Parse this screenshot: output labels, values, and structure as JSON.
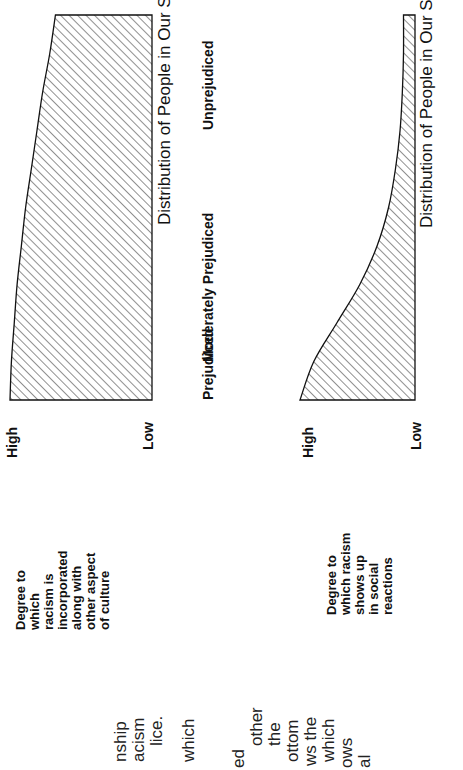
{
  "body_text_fragments": [
    "nship",
    "acism",
    "lice.",
    "which",
    "ed",
    "other",
    "the",
    "ottom",
    "ws the",
    "which",
    "ows",
    "al"
  ],
  "chart_data": [
    {
      "type": "area",
      "title": "",
      "xlabel": "Distribution of People in Our Society",
      "ylabel": "Degree to which racism is incorporated along with other aspect of culture",
      "y_ticks": [
        "High",
        "Low"
      ],
      "x_categories": [
        "Prejudiced",
        "Moderately Prejudiced",
        "Unprejudiced"
      ],
      "x": [
        0,
        0.1,
        0.2,
        0.3,
        0.4,
        0.5,
        0.6,
        0.7,
        0.8,
        0.9,
        1.0
      ],
      "values": [
        1.0,
        0.99,
        0.97,
        0.95,
        0.92,
        0.89,
        0.85,
        0.81,
        0.77,
        0.72,
        0.68
      ],
      "ylim": [
        0,
        1
      ],
      "fill": "diagonal-hatch"
    },
    {
      "type": "area",
      "title": "",
      "xlabel": "Distribution of People in Our Society",
      "ylabel": "Degree to which racism shows up in social reactions",
      "y_ticks": [
        "High",
        "Low"
      ],
      "x_categories": [
        "Prejudiced",
        "Moderately Prejudiced",
        "Unprejudiced"
      ],
      "x": [
        0,
        0.1,
        0.2,
        0.3,
        0.4,
        0.5,
        0.6,
        0.7,
        0.8,
        0.9,
        1.0
      ],
      "values": [
        1.0,
        0.88,
        0.68,
        0.48,
        0.33,
        0.23,
        0.17,
        0.13,
        0.11,
        0.1,
        0.1
      ],
      "ylim": [
        0,
        1
      ],
      "fill": "diagonal-hatch"
    }
  ],
  "labels": {
    "top_ylabel_lines": [
      "Degree to",
      "which",
      "racism is",
      "incorporated",
      "along with",
      "other aspect",
      "of culture"
    ],
    "bottom_ylabel_lines": [
      "Degree to",
      "which racism",
      "shows up",
      "in social",
      "reactions"
    ],
    "high": "High",
    "low": "Low"
  }
}
